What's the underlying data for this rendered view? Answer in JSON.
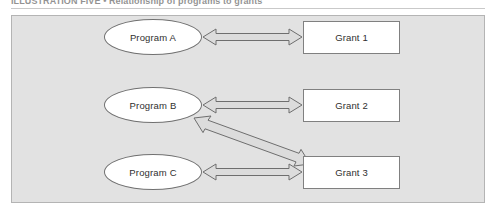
{
  "caption": {
    "text": "ILLUSTRATION FIVE  •  Relationship of programs to grants"
  },
  "figure": {
    "panel_bg": "#e2e2e2",
    "panel_border": "#b4b4b4",
    "node_fill": "#ffffff",
    "arrow_fill": "#dcdcdc",
    "arrow_stroke": "#6e6e6e"
  },
  "diagram": {
    "type": "relationship-diagram",
    "programs": [
      {
        "id": "program-a",
        "label": "Program A",
        "shape": "ellipse",
        "x": 104,
        "y": 19,
        "w": 98,
        "h": 36
      },
      {
        "id": "program-b",
        "label": "Program B",
        "shape": "ellipse",
        "x": 104,
        "y": 87,
        "w": 98,
        "h": 36
      },
      {
        "id": "program-c",
        "label": "Program C",
        "shape": "ellipse",
        "x": 104,
        "y": 154,
        "w": 98,
        "h": 36
      }
    ],
    "grants": [
      {
        "id": "grant-1",
        "label": "Grant 1",
        "shape": "rectangle",
        "x": 303,
        "y": 21,
        "w": 97,
        "h": 33
      },
      {
        "id": "grant-2",
        "label": "Grant 2",
        "shape": "rectangle",
        "x": 303,
        "y": 89,
        "w": 97,
        "h": 33
      },
      {
        "id": "grant-3",
        "label": "Grant 3",
        "shape": "rectangle",
        "x": 303,
        "y": 156,
        "w": 97,
        "h": 33
      }
    ],
    "connectors": [
      {
        "id": "connector-a-1",
        "from": "program-a",
        "to": "grant-1",
        "style": "double-headed-arrow",
        "orientation": "horizontal"
      },
      {
        "id": "connector-b-2",
        "from": "program-b",
        "to": "grant-2",
        "style": "double-headed-arrow",
        "orientation": "horizontal"
      },
      {
        "id": "connector-b-3",
        "from": "program-b",
        "to": "grant-3",
        "style": "double-headed-arrow",
        "orientation": "diagonal"
      },
      {
        "id": "connector-c-3",
        "from": "program-c",
        "to": "grant-3",
        "style": "double-headed-arrow",
        "orientation": "horizontal"
      }
    ]
  }
}
